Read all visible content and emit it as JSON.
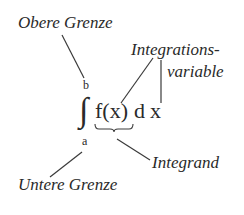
{
  "diagram": {
    "formula": {
      "integral_sign": "∫",
      "upper_limit": "b",
      "lower_limit": "a",
      "integrand": "f(x)",
      "differential_d": "d",
      "variable": "x"
    },
    "labels": {
      "upper_bound": "Obere Grenze",
      "lower_bound": "Untere Grenze",
      "variable_line1": "Integrations-",
      "variable_line2": "variable",
      "integrand": "Integrand"
    },
    "colors": {
      "text": "#2a2a2a",
      "lines": "#3a3a3a",
      "background": "#ffffff"
    }
  }
}
